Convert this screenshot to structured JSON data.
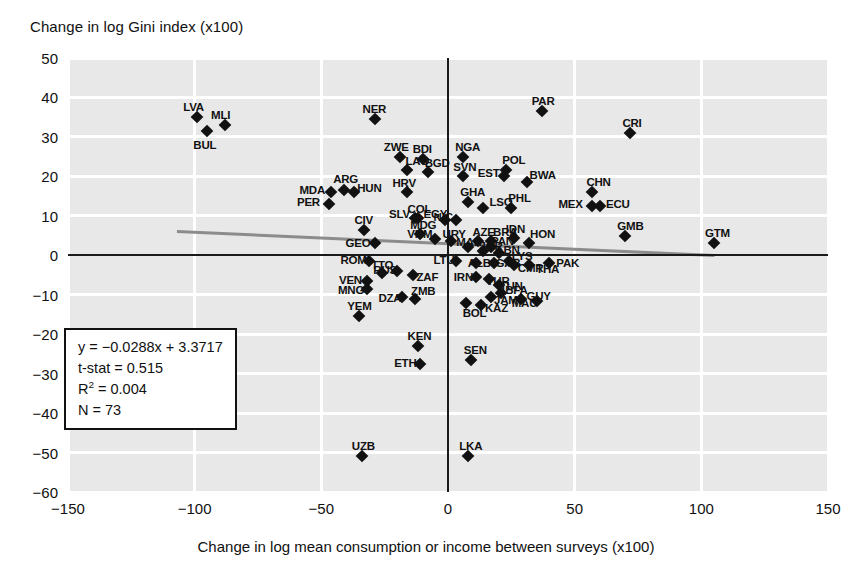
{
  "chart_data": {
    "type": "scatter",
    "title": "",
    "ylabel": "Change in log Gini index (x100)",
    "xlabel": "Change in log mean consumption or income between surveys (x100)",
    "xlim": [
      -150,
      150
    ],
    "ylim": [
      -60,
      50
    ],
    "xticks": [
      -150,
      -100,
      -50,
      0,
      50,
      100,
      150
    ],
    "yticks": [
      50,
      40,
      30,
      20,
      10,
      0,
      -10,
      -20,
      -30,
      -40,
      -50,
      -60
    ],
    "xticklabels": [
      "−150",
      "−100",
      "−50",
      "0",
      "50",
      "100",
      "150"
    ],
    "yticklabels": [
      "50",
      "40",
      "30",
      "20",
      "10",
      "0",
      "−10",
      "−20",
      "−30",
      "−40",
      "−50",
      "−60"
    ],
    "grid": true,
    "legend": "none",
    "trendline": {
      "slope": -0.0288,
      "intercept": 3.3717,
      "x_start": -107,
      "x_end": 105,
      "color": "#8c8c8c"
    },
    "annotation_box": {
      "equation": "y = −0.0288x + 3.3717",
      "tstat": "t-stat = 0.515",
      "r2_label": "R",
      "r2_exp": "2",
      "r2_value": " = 0.004",
      "n": "N = 73"
    },
    "points": [
      {
        "label": "LVA",
        "x": -99,
        "y": 35.0,
        "lx": -14,
        "ly": -16
      },
      {
        "label": "BUL",
        "x": -95,
        "y": 31.5,
        "lx": -14,
        "ly": 8
      },
      {
        "label": "MLI",
        "x": -88,
        "y": 33.0,
        "lx": -14,
        "ly": -16
      },
      {
        "label": "NER",
        "x": -29,
        "y": 34.5,
        "lx": -12,
        "ly": -16
      },
      {
        "label": "ZWE",
        "x": -19,
        "y": 25.0,
        "lx": -16,
        "ly": -16
      },
      {
        "label": "LAO",
        "x": -16,
        "y": 21.5,
        "lx": -2,
        "ly": -15
      },
      {
        "label": "BDI",
        "x": -10,
        "y": 24.5,
        "lx": -10,
        "ly": -16
      },
      {
        "label": "BGD",
        "x": -8,
        "y": 21.0,
        "lx": -3,
        "ly": -15
      },
      {
        "label": "HRV",
        "x": -16,
        "y": 16.0,
        "lx": -15,
        "ly": -15
      },
      {
        "label": "MDA",
        "x": -46,
        "y": 16.0,
        "lx": -32,
        "ly": -8
      },
      {
        "label": "ARG",
        "x": -41,
        "y": 16.5,
        "lx": -11,
        "ly": -17
      },
      {
        "label": "HUN",
        "x": -37,
        "y": 16.0,
        "lx": 3,
        "ly": -10
      },
      {
        "label": "PER",
        "x": -47,
        "y": 13.0,
        "lx": -32,
        "ly": -8
      },
      {
        "label": "COL",
        "x": -12,
        "y": 9.5,
        "lx": -10,
        "ly": -15
      },
      {
        "label": "SLV",
        "x": -13,
        "y": 9.5,
        "lx": -26,
        "ly": -10
      },
      {
        "label": "CIV",
        "x": -33,
        "y": 6.5,
        "lx": -10,
        "ly": -16
      },
      {
        "label": "MDG",
        "x": -11,
        "y": 5.5,
        "lx": -10,
        "ly": -15
      },
      {
        "label": "GEO",
        "x": -29,
        "y": 3.0,
        "lx": -29,
        "ly": -6
      },
      {
        "label": "EGY",
        "x": -1,
        "y": 9.0,
        "lx": -22,
        "ly": -12
      },
      {
        "label": "VNM",
        "x": -5,
        "y": 4.0,
        "lx": -28,
        "ly": -11
      },
      {
        "label": "URY",
        "x": 1,
        "y": 3.5,
        "lx": -8,
        "ly": -13
      },
      {
        "label": "NGA",
        "x": 6,
        "y": 25.0,
        "lx": -8,
        "ly": -16
      },
      {
        "label": "SVN",
        "x": 6,
        "y": 20.0,
        "lx": -10,
        "ly": -15
      },
      {
        "label": "EST",
        "x": 22,
        "y": 20.0,
        "lx": -26,
        "ly": -9
      },
      {
        "label": "POL",
        "x": 23,
        "y": 21.5,
        "lx": -4,
        "ly": -16
      },
      {
        "label": "BWA",
        "x": 31,
        "y": 18.5,
        "lx": 3,
        "ly": -13
      },
      {
        "label": "PAR",
        "x": 37,
        "y": 36.5,
        "lx": -10,
        "ly": -16
      },
      {
        "label": "CRI",
        "x": 72,
        "y": 31.0,
        "lx": -8,
        "ly": -16
      },
      {
        "label": "CHN",
        "x": 57,
        "y": 16.0,
        "lx": -6,
        "ly": -16
      },
      {
        "label": "MEX",
        "x": 57,
        "y": 12.5,
        "lx": -34,
        "ly": -8
      },
      {
        "label": "ECU",
        "x": 60,
        "y": 12.5,
        "lx": 6,
        "ly": -8
      },
      {
        "label": "GHA",
        "x": 8,
        "y": 13.5,
        "lx": -8,
        "ly": -16
      },
      {
        "label": "LSO",
        "x": 14,
        "y": 12.0,
        "lx": 6,
        "ly": -12
      },
      {
        "label": "PHL",
        "x": 25,
        "y": 12.0,
        "lx": -3,
        "ly": -16
      },
      {
        "label": "NIC",
        "x": 3,
        "y": 9.0,
        "lx": -22,
        "ly": -9
      },
      {
        "label": "IDN",
        "x": 26,
        "y": 4.5,
        "lx": -8,
        "ly": -15
      },
      {
        "label": "HON",
        "x": 32,
        "y": 3.0,
        "lx": 1,
        "ly": -15
      },
      {
        "label": "GMB",
        "x": 70,
        "y": 5.0,
        "lx": -8,
        "ly": -16
      },
      {
        "label": "GTM",
        "x": 105,
        "y": 3.0,
        "lx": -9,
        "ly": -16
      },
      {
        "label": "AZE",
        "x": 12,
        "y": 3.5,
        "lx": -6,
        "ly": -15
      },
      {
        "label": "BRA",
        "x": 17,
        "y": 3.5,
        "lx": 2,
        "ly": -15
      },
      {
        "label": "MAR",
        "x": 8,
        "y": 2.0,
        "lx": -12,
        "ly": -11
      },
      {
        "label": "PAN",
        "x": 17,
        "y": 2.0,
        "lx": 0,
        "ly": -12
      },
      {
        "label": "JOR",
        "x": 14,
        "y": 1.0,
        "lx": -4,
        "ly": -11
      },
      {
        "label": "LBN",
        "x": 20,
        "y": 0.5,
        "lx": -2,
        "ly": -9
      },
      {
        "label": "LYS",
        "x": 24,
        "y": -1.5,
        "lx": 3,
        "ly": -11
      },
      {
        "label": "LTU",
        "x": 3,
        "y": -1.5,
        "lx": -22,
        "ly": -7
      },
      {
        "label": "ALB",
        "x": 11,
        "y": -2.0,
        "lx": -8,
        "ly": -6
      },
      {
        "label": "GAB",
        "x": 18,
        "y": -2.0,
        "lx": 2,
        "ly": -6
      },
      {
        "label": "CMR",
        "x": 26,
        "y": -2.5,
        "lx": 4,
        "ly": -3
      },
      {
        "label": "THA",
        "x": 32,
        "y": -2.5,
        "lx": 7,
        "ly": -2
      },
      {
        "label": "PAK",
        "x": 40,
        "y": -2.0,
        "lx": 7,
        "ly": -6
      },
      {
        "label": "IRN",
        "x": 11,
        "y": -5.5,
        "lx": -22,
        "ly": -6
      },
      {
        "label": "TUR",
        "x": 16,
        "y": -6.0,
        "lx": -2,
        "ly": -4
      },
      {
        "label": "TUN",
        "x": 20,
        "y": -7.5,
        "lx": 1,
        "ly": -5
      },
      {
        "label": "BFA",
        "x": 21,
        "y": -9.5,
        "lx": 4,
        "ly": -9
      },
      {
        "label": "JAM",
        "x": 17,
        "y": -10.5,
        "lx": 3,
        "ly": -3
      },
      {
        "label": "GUY",
        "x": 29,
        "y": -11.0,
        "lx": 5,
        "ly": -9
      },
      {
        "label": "MAU",
        "x": 35,
        "y": -11.5,
        "lx": -25,
        "ly": -4
      },
      {
        "label": "KAZ",
        "x": 13,
        "y": -12.5,
        "lx": 4,
        "ly": -3
      },
      {
        "label": "BOL",
        "x": 7,
        "y": -12.0,
        "lx": -3,
        "ly": 4
      },
      {
        "label": "RUS",
        "x": -20,
        "y": -4.0,
        "lx": -24,
        "ly": -7
      },
      {
        "label": "ZAF",
        "x": -14,
        "y": -5.0,
        "lx": 4,
        "ly": -4
      },
      {
        "label": "TTO",
        "x": -26,
        "y": -4.5,
        "lx": -11,
        "ly": -14
      },
      {
        "label": "ROM",
        "x": -31,
        "y": -1.5,
        "lx": -29,
        "ly": -7
      },
      {
        "label": "VEN",
        "x": -32,
        "y": -6.5,
        "lx": -28,
        "ly": -7
      },
      {
        "label": "MNG",
        "x": -32,
        "y": -8.5,
        "lx": -29,
        "ly": -5
      },
      {
        "label": "YEM",
        "x": -35,
        "y": -15.5,
        "lx": -12,
        "ly": -16
      },
      {
        "label": "DZA",
        "x": -18,
        "y": -10.5,
        "lx": -24,
        "ly": -5
      },
      {
        "label": "ZMB",
        "x": -13,
        "y": -11.0,
        "lx": -4,
        "ly": -14
      },
      {
        "label": "KEN",
        "x": -12,
        "y": -23.0,
        "lx": -10,
        "ly": -16
      },
      {
        "label": "ETH",
        "x": -11,
        "y": -27.5,
        "lx": -26,
        "ly": -7
      },
      {
        "label": "SEN",
        "x": 9,
        "y": -26.5,
        "lx": -7,
        "ly": -16
      },
      {
        "label": "UZB",
        "x": -34,
        "y": -51.0,
        "lx": -10,
        "ly": -16
      },
      {
        "label": "LKA",
        "x": 8,
        "y": -51.0,
        "lx": -9,
        "ly": -16
      }
    ]
  }
}
